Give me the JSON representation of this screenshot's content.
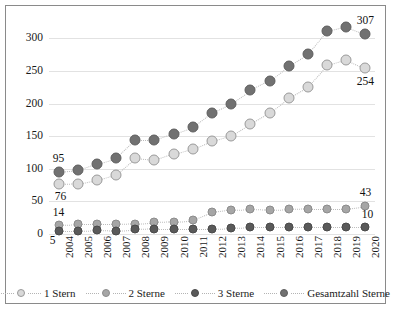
{
  "chart_data": {
    "type": "line",
    "title": "",
    "xlabel": "",
    "ylabel": "",
    "ylim": [
      0,
      325
    ],
    "yticks": [
      0,
      50,
      100,
      150,
      200,
      250,
      300
    ],
    "grid": true,
    "legend_position": "bottom",
    "categories": [
      "2004",
      "2005",
      "2006",
      "2007",
      "2008",
      "2009",
      "2010",
      "2011",
      "2012",
      "2013",
      "2014",
      "2015",
      "2016",
      "2017",
      "2018",
      "2019",
      "2020"
    ],
    "series": [
      {
        "name": "1 Stern",
        "color": "#d9d9d9",
        "edge": "#9a9a9a",
        "values": [
          76,
          77,
          83,
          91,
          116,
          113,
          123,
          131,
          143,
          151,
          169,
          186,
          209,
          226,
          259,
          267,
          254
        ]
      },
      {
        "name": "2 Sterne",
        "color": "#a6a6a6",
        "edge": "#8c8c8c",
        "values": [
          14,
          15,
          15,
          15,
          16,
          18,
          19,
          21,
          33,
          37,
          38,
          37,
          38,
          39,
          39,
          39,
          43
        ]
      },
      {
        "name": "3 Sterne",
        "color": "#5a5a5a",
        "edge": "#4a4a4a",
        "values": [
          5,
          5,
          6,
          5,
          7,
          8,
          8,
          8,
          8,
          9,
          10,
          10,
          10,
          10,
          10,
          10,
          10
        ]
      },
      {
        "name": "Gesamtzahl Sterne",
        "color": "#717171",
        "edge": "#5e5e5e",
        "values": [
          95,
          98,
          108,
          116,
          144,
          144,
          154,
          164,
          186,
          200,
          220,
          235,
          258,
          276,
          311,
          318,
          307
        ]
      }
    ],
    "point_labels": [
      {
        "series": "Gesamtzahl Sterne",
        "category": "2004",
        "text": "95",
        "dx": 0,
        "dy": -13
      },
      {
        "series": "1 Stern",
        "category": "2004",
        "text": "76",
        "dx": 2,
        "dy": 13
      },
      {
        "series": "2 Sterne",
        "category": "2004",
        "text": "14",
        "dx": 0,
        "dy": -12
      },
      {
        "series": "3 Sterne",
        "category": "2004",
        "text": "5",
        "dx": -6,
        "dy": 10
      },
      {
        "series": "Gesamtzahl Sterne",
        "category": "2020",
        "text": "307",
        "dx": 0,
        "dy": -13
      },
      {
        "series": "1 Stern",
        "category": "2020",
        "text": "254",
        "dx": 0,
        "dy": 14
      },
      {
        "series": "2 Sterne",
        "category": "2020",
        "text": "43",
        "dx": 0,
        "dy": -13
      },
      {
        "series": "3 Sterne",
        "category": "2020",
        "text": "10",
        "dx": 2,
        "dy": -12
      }
    ]
  }
}
